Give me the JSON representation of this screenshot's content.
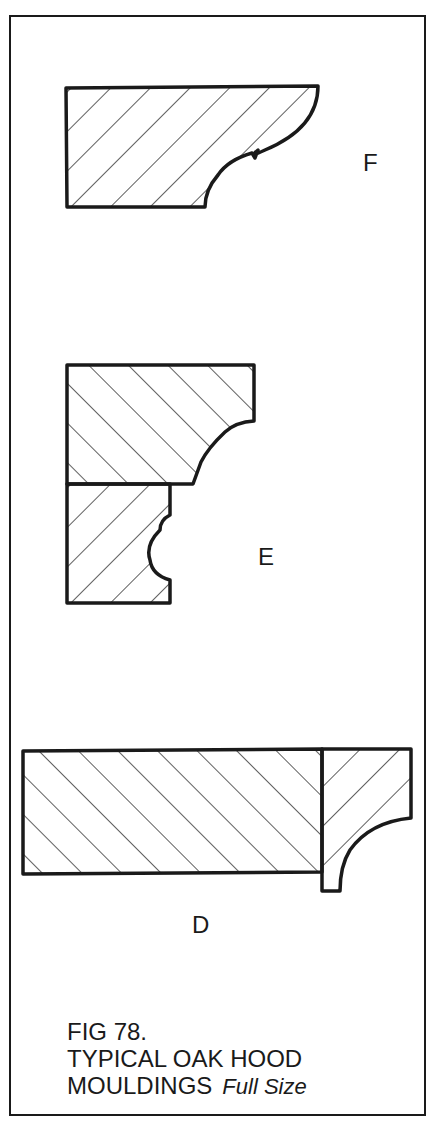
{
  "figure": {
    "number_label": "FIG 78.",
    "title_line1": "TYPICAL OAK HOOD",
    "title_line2": "MOULDINGS",
    "scale_note": "Full Size"
  },
  "profiles": [
    {
      "id": "F",
      "label": "F",
      "description": "single-piece hood moulding with cove and bead"
    },
    {
      "id": "E",
      "label": "E",
      "description": "two-piece hood moulding with ovolo and cove"
    },
    {
      "id": "D",
      "label": "D",
      "description": "wide board with applied cove moulding"
    }
  ],
  "colors": {
    "ink": "#1a1a1a",
    "paper": "#ffffff"
  }
}
